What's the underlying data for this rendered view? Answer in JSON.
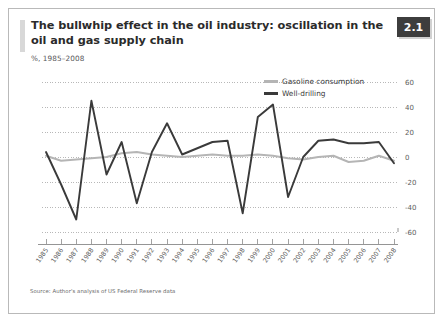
{
  "header": {
    "title": "The bullwhip effect in the oil industry: oscillation in the oil and gas supply chain",
    "subtitle": "%, 1985–2008",
    "badge": "2.1"
  },
  "footer": {
    "source": "Source: Author's analysis of US Federal Reserve data"
  },
  "legend": {
    "items": [
      {
        "label": "Gasoline consumption",
        "color": "#b5b5b5"
      },
      {
        "label": "Well-drilling",
        "color": "#3a3a3a"
      }
    ]
  },
  "colors": {
    "gasoline": "#b5b5b5",
    "well_drilling": "#3a3a3a",
    "gridline": "#9a9a9a",
    "axis": "#7a7a7a",
    "badge_bg": "#3d3d3d",
    "accent_bar": "#d8d8d8",
    "frame_border": "#b9b9b9"
  },
  "chart_data": {
    "type": "line",
    "title": "The bullwhip effect in the oil industry: oscillation in the oil and gas supply chain",
    "subtitle": "%, 1985–2008",
    "xlabel": "",
    "ylabel": "%",
    "ylim": [
      -60,
      60
    ],
    "yticks": [
      60,
      40,
      20,
      0,
      -20,
      -40,
      -60
    ],
    "grid": true,
    "legend_position": "top-right",
    "categories": [
      "1985",
      "1986",
      "1987",
      "1988",
      "1989",
      "1990",
      "1991",
      "1992",
      "1993",
      "1994",
      "1995",
      "1996",
      "1997",
      "1998",
      "1999",
      "2000",
      "2001",
      "2002",
      "2003",
      "2004",
      "2005",
      "2006",
      "2007",
      "2008"
    ],
    "series": [
      {
        "name": "Gasoline consumption",
        "color": "#b5b5b5",
        "values": [
          1,
          -3,
          -2,
          -1,
          0,
          3,
          4,
          2,
          1,
          0,
          1,
          2,
          1,
          1,
          2,
          1,
          -1,
          -2,
          0,
          1,
          -4,
          -3,
          1,
          -3
        ]
      },
      {
        "name": "Well-drilling",
        "color": "#3a3a3a",
        "values": [
          4,
          -22,
          -50,
          45,
          -14,
          12,
          -37,
          4,
          27,
          2,
          7,
          12,
          13,
          -45,
          32,
          42,
          -32,
          0,
          13,
          14,
          11,
          11,
          12,
          -5
        ]
      }
    ]
  }
}
